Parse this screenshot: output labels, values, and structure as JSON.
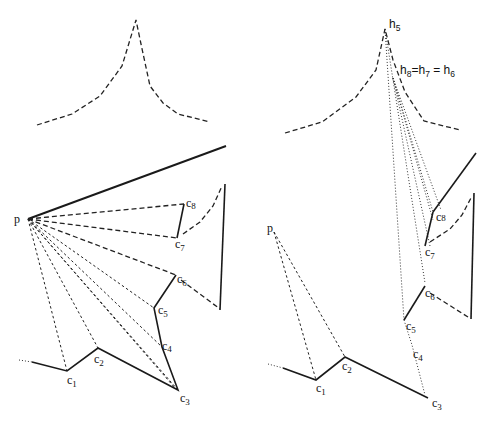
{
  "left_panel": {
    "point_label": "p",
    "vertices": [
      {
        "name": "c",
        "sub": "1"
      },
      {
        "name": "c",
        "sub": "2"
      },
      {
        "name": "c",
        "sub": "3"
      },
      {
        "name": "c",
        "sub": "4"
      },
      {
        "name": "c",
        "sub": "5"
      },
      {
        "name": "c",
        "sub": "6"
      },
      {
        "name": "c",
        "sub": "7"
      },
      {
        "name": "c",
        "sub": "8"
      }
    ]
  },
  "right_panel": {
    "point_label": "p",
    "apex_label": {
      "name": "h",
      "sub": "5"
    },
    "equality_label": {
      "h8": "h",
      "s8": "8",
      "eq1": "=",
      "h7": "h",
      "s7": "7",
      "eq2": " = ",
      "h6": "h",
      "s6": "6"
    },
    "vertices": [
      {
        "name": "c",
        "sub": "1"
      },
      {
        "name": "c",
        "sub": "2"
      },
      {
        "name": "c",
        "sub": "3"
      },
      {
        "name": "c",
        "sub": "4"
      },
      {
        "name": "c",
        "sub": "5"
      },
      {
        "name": "c",
        "sub": "6"
      },
      {
        "name": "c",
        "sub": "7"
      },
      {
        "name": "c",
        "sub": "8"
      }
    ]
  }
}
